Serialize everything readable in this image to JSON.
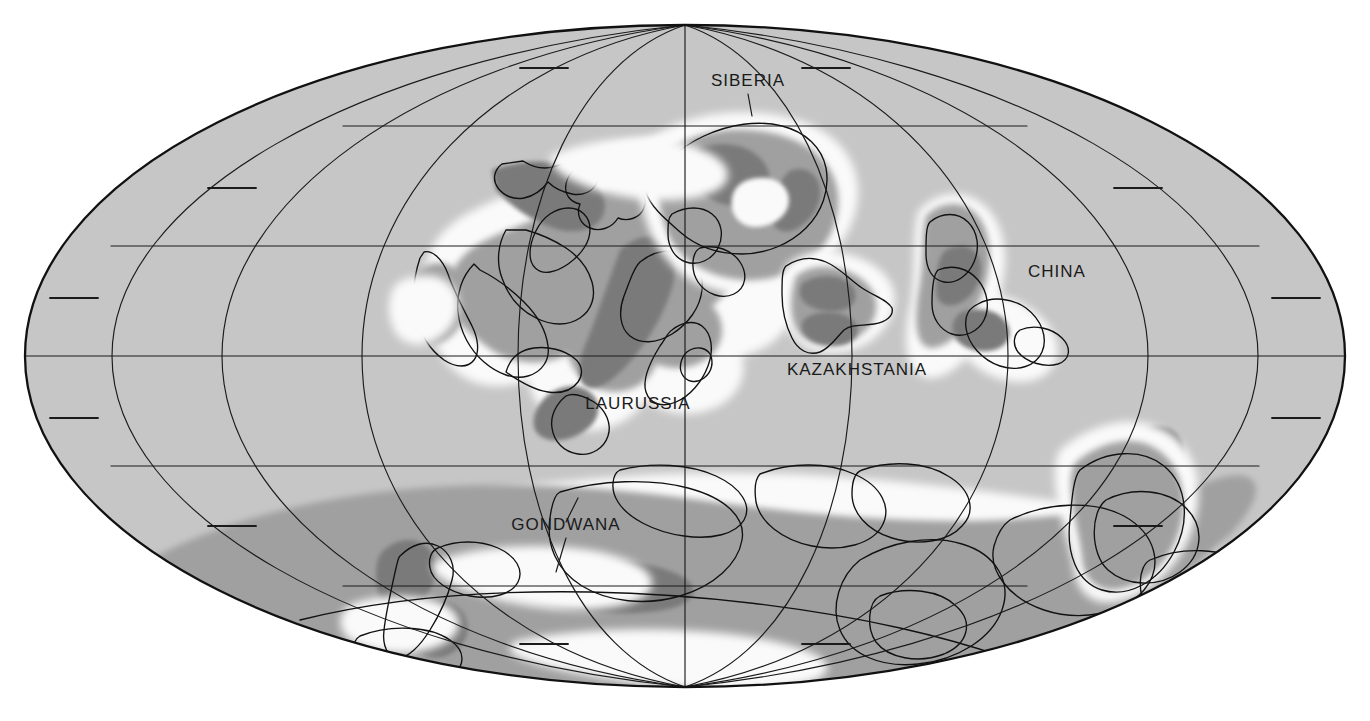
{
  "figure": {
    "kind": "paleogeographic-world-map",
    "projection": "Mollweide elliptical (equal-area)",
    "background_color": "#ffffff",
    "ocean_color": "#c6c6c6",
    "shelf_lowland_color": "#fafafa",
    "upland_color": "#a0a0a0",
    "mountain_color": "#7a7a7a",
    "outline_color": "#111111",
    "label_color": "#1a1a1a"
  },
  "graticule": {
    "center_x": 685,
    "center_y": 356,
    "semi_axis_x": 660,
    "semi_axis_y": 331,
    "meridian_interval_deg": 30,
    "full_parallel_latitudes": [
      -60,
      -30,
      0,
      30,
      60
    ],
    "tick_parallel_latitudes": [
      -75,
      -45,
      15,
      45,
      75
    ],
    "equator_y": 356
  },
  "labels": [
    {
      "id": "siberia",
      "text": "SIBERIA",
      "x": 748,
      "y": 86,
      "anchor": "middle"
    },
    {
      "id": "china",
      "text": "CHINA",
      "x": 1057,
      "y": 277,
      "anchor": "middle"
    },
    {
      "id": "kazakhstania",
      "text": "KAZAKHSTANIA",
      "x": 857,
      "y": 375,
      "anchor": "middle"
    },
    {
      "id": "laurussia",
      "text": "LAURUSSIA",
      "x": 638,
      "y": 409,
      "anchor": "middle"
    },
    {
      "id": "gondwana",
      "text": "GONDWANA",
      "x": 566,
      "y": 530,
      "anchor": "middle"
    }
  ],
  "continents": [
    {
      "id": "laurussia",
      "name": "LAURUSSIA"
    },
    {
      "id": "siberia",
      "name": "SIBERIA"
    },
    {
      "id": "kazakhstania",
      "name": "KAZAKHSTANIA"
    },
    {
      "id": "china",
      "name": "CHINA"
    },
    {
      "id": "gondwana",
      "name": "GONDWANA"
    }
  ],
  "terrain_classes": [
    {
      "id": "ocean",
      "label": "Ocean / shallow sea",
      "color": "#c6c6c6"
    },
    {
      "id": "lowland",
      "label": "Coastal plain / shelf",
      "color": "#fafafa"
    },
    {
      "id": "upland",
      "label": "Upland",
      "color": "#a0a0a0"
    },
    {
      "id": "mountain",
      "label": "Mountain belt",
      "color": "#7a7a7a"
    }
  ]
}
